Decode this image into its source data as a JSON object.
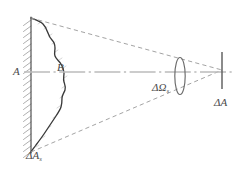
{
  "figure": {
    "type": "diagram",
    "width": 248,
    "height": 175,
    "background_color": "#ffffff"
  },
  "labels": {
    "surface_axis": {
      "text": "A",
      "name": "label-A",
      "x": 13,
      "y": 66
    },
    "boundary_curve": {
      "text": "B",
      "name": "label-B",
      "x": 57,
      "y": 62
    },
    "source_area": {
      "base": "ΔA",
      "subscript": "s",
      "name": "label-delta-A-s",
      "x": 26,
      "y": 150
    },
    "solid_angle": {
      "base": "ΔΩ",
      "subscript": "s",
      "name": "label-delta-omega-s",
      "x": 152,
      "y": 82
    },
    "receiver_area": {
      "base": "ΔA",
      "subscript": "",
      "name": "label-delta-A",
      "x": 214,
      "y": 97
    }
  },
  "colors": {
    "curve_stroke": "#3a3a3a",
    "wall_stroke": "#4a4a4a",
    "hatch_stroke": "#8f8f8f",
    "dashed_stroke": "#9a9a9a",
    "axis_stroke": "#b5b5b5",
    "ellipse_stroke": "#6a6a6a",
    "detector_stroke": "#5a5a5a",
    "text": "#4a4a4a",
    "background": "#ffffff"
  },
  "geometry": {
    "wall_line": {
      "x": 31,
      "y_top": 18,
      "y_bottom": 152
    },
    "apex": {
      "x": 222,
      "y": 70
    },
    "top_vertex": {
      "x": 31,
      "y": 18
    },
    "bottom_vertex": {
      "x": 31,
      "y": 152
    },
    "axis_line": {
      "x1": 24,
      "y1": 72,
      "x2": 232,
      "y2": 72
    },
    "aperture_ellipse": {
      "cx": 180,
      "cy": 76,
      "rx": 5,
      "ry": 18
    },
    "detector_bar": {
      "x": 222,
      "y_top": 52,
      "y_bottom": 89
    },
    "hatch_count": 23
  },
  "elements": [
    {
      "name": "hatched-wall",
      "description": "vertical hatched boundary wall at left representing surface A"
    },
    {
      "name": "source-boundary-curve",
      "description": "wavy solid curve B enclosing the source area"
    },
    {
      "name": "upper-dashed-ray",
      "description": "dashed ray from top vertex to apex"
    },
    {
      "name": "lower-dashed-ray",
      "description": "dashed ray from bottom vertex to apex"
    },
    {
      "name": "optical-axis",
      "description": "horizontal dash-dot centre axis"
    },
    {
      "name": "solid-angle-aperture",
      "description": "narrow vertical ellipse marking the solid angle cross-section"
    },
    {
      "name": "detector-bar",
      "description": "short vertical bar at right representing receiving area"
    }
  ]
}
